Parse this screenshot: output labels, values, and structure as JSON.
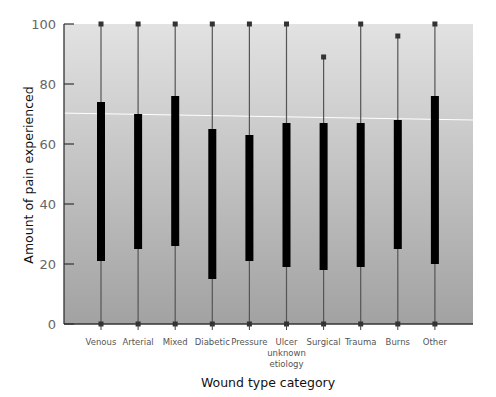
{
  "chart_data": {
    "type": "boxplot",
    "title": "",
    "xlabel": "Wound type category",
    "ylabel": "Amount of pain experienced",
    "ylim": [
      0,
      100
    ],
    "yticks": [
      0,
      20,
      40,
      60,
      80,
      100
    ],
    "grid": false,
    "legend": null,
    "categories": [
      {
        "label": [
          "Venous"
        ],
        "min": 0,
        "q1": 21,
        "q3": 74,
        "max": 100
      },
      {
        "label": [
          "Arterial"
        ],
        "min": 0,
        "q1": 25,
        "q3": 70,
        "max": 100
      },
      {
        "label": [
          "Mixed"
        ],
        "min": 0,
        "q1": 26,
        "q3": 76,
        "max": 100
      },
      {
        "label": [
          "Diabetic"
        ],
        "min": 0,
        "q1": 15,
        "q3": 65,
        "max": 100
      },
      {
        "label": [
          "Pressure"
        ],
        "min": 0,
        "q1": 21,
        "q3": 63,
        "max": 100
      },
      {
        "label": [
          "Ulcer",
          "unknown",
          "etiology"
        ],
        "min": 0,
        "q1": 19,
        "q3": 67,
        "max": 100
      },
      {
        "label": [
          "Surgical"
        ],
        "min": 0,
        "q1": 18,
        "q3": 67,
        "max": 89
      },
      {
        "label": [
          "Trauma"
        ],
        "min": 0,
        "q1": 19,
        "q3": 67,
        "max": 100
      },
      {
        "label": [
          "Burns"
        ],
        "min": 0,
        "q1": 25,
        "q3": 68,
        "max": 96
      },
      {
        "label": [
          "Other"
        ],
        "min": 0,
        "q1": 20,
        "q3": 76,
        "max": 100
      }
    ],
    "reference_line": {
      "y_start": 70.3,
      "y_end": 68,
      "color": "#ffffff"
    },
    "colors": {
      "box": "#000000",
      "whisker": "#555555",
      "plot_bg_top": "#e2e2e2",
      "plot_bg_bottom": "#a2a2a2",
      "axis": "#333333"
    }
  }
}
